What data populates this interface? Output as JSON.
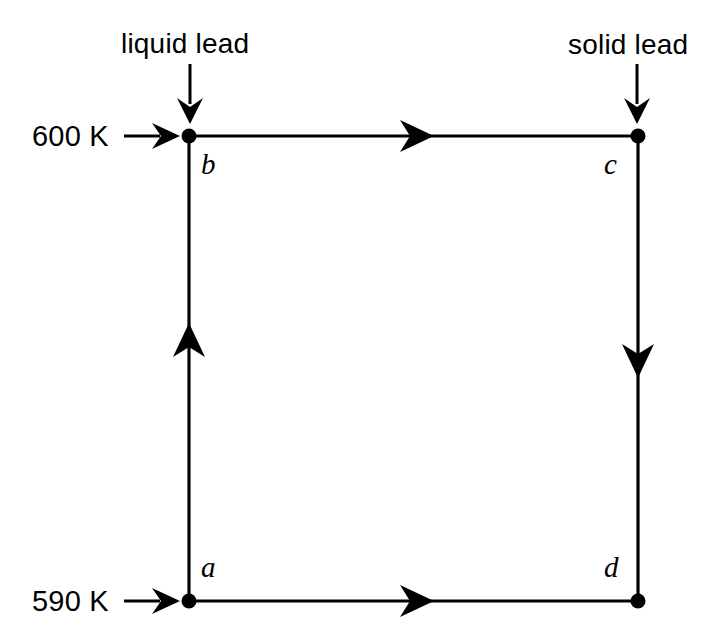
{
  "figure": {
    "background_color": "#ffffff",
    "stroke_color": "#000000",
    "line_width_px": 3,
    "vertex_dot_radius_px": 7
  },
  "temperature_labels": [
    {
      "id": "hot-reservoir",
      "text": "600 K",
      "arrow": "right-arrow-icon",
      "points_to": "b",
      "x": 32,
      "y": 122
    },
    {
      "id": "cold-reservoir",
      "text": "590 K",
      "arrow": "right-arrow-icon",
      "points_to": "a",
      "x": 32,
      "y": 587
    }
  ],
  "phase_labels": [
    {
      "id": "liquid-lead",
      "text": "liquid lead",
      "arrow": "down-arrow-icon",
      "points_to": "b",
      "x": 121,
      "y": 30
    },
    {
      "id": "solid-lead",
      "text": "solid lead",
      "arrow": "down-arrow-icon",
      "points_to": "c",
      "x": 568,
      "y": 31
    }
  ],
  "vertices": [
    {
      "id": "a",
      "label": "a",
      "x": 189,
      "y": 601,
      "label_x": 201,
      "label_y": 553
    },
    {
      "id": "b",
      "label": "b",
      "x": 189,
      "y": 136,
      "label_x": 201,
      "label_y": 150
    },
    {
      "id": "c",
      "label": "c",
      "x": 638,
      "y": 136,
      "label_x": 604,
      "label_y": 150
    },
    {
      "id": "d",
      "label": "d",
      "x": 638,
      "y": 601,
      "label_x": 604,
      "label_y": 553
    }
  ],
  "edges": [
    {
      "id": "b-to-c",
      "from": "b",
      "to": "c",
      "direction": "right",
      "arrow_x": 424,
      "arrow_y": 136
    },
    {
      "id": "c-to-d",
      "from": "c",
      "to": "d",
      "direction": "down",
      "arrow_x": 638,
      "arrow_y": 368
    },
    {
      "id": "a-to-d",
      "from": "a",
      "to": "d",
      "direction": "right",
      "arrow_x": 424,
      "arrow_y": 601
    },
    {
      "id": "a-to-b",
      "from": "a",
      "to": "b",
      "direction": "up",
      "arrow_x": 189,
      "arrow_y": 333
    }
  ],
  "caption": {
    "visible": false,
    "text": ""
  }
}
